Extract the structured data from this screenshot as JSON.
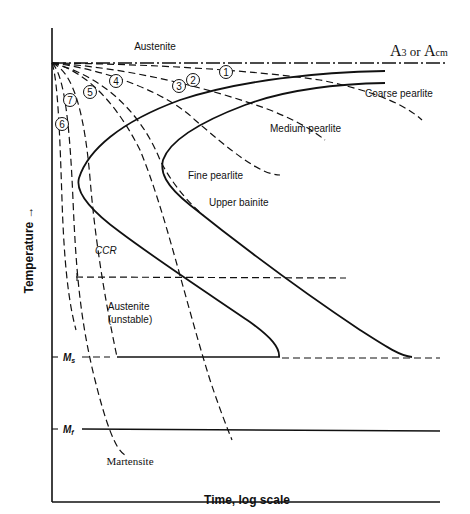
{
  "diagram": {
    "axes": {
      "x_label": "Time, log scale",
      "y_label": "Temperature →"
    },
    "lines": {
      "a3_label_main": "A",
      "a3_label_sub": "3",
      "a3_label_or": " or ",
      "acm_label_main": "A",
      "acm_label_sub": "cm",
      "ms_label_main": "M",
      "ms_label_sub": "s",
      "mf_label_main": "M",
      "mf_label_sub": "f"
    },
    "regions": {
      "austenite_top": "Austenite",
      "austenite_unstable_line1": "Austenite",
      "austenite_unstable_line2": "(unstable)",
      "martensite": "Martensite",
      "ccr": "CCR"
    },
    "products": {
      "coarse_pearlite": "Coarse pearlite",
      "medium_pearlite": "Medium pearlite",
      "fine_pearlite": "Fine pearlite",
      "upper_bainite": "Upper bainite"
    },
    "cooling_curves": [
      {
        "id": "1",
        "label": "1",
        "product": "Coarse pearlite"
      },
      {
        "id": "2",
        "label": "2",
        "product": "Medium pearlite"
      },
      {
        "id": "3",
        "label": "3",
        "product": "Fine pearlite"
      },
      {
        "id": "4",
        "label": "4",
        "product": "Upper bainite / martensite"
      },
      {
        "id": "5",
        "label": "5",
        "product": "Martensite (CCR)"
      },
      {
        "id": "6",
        "label": "6",
        "product": "Martensite"
      },
      {
        "id": "7",
        "label": "7",
        "product": "Martensite"
      }
    ]
  }
}
